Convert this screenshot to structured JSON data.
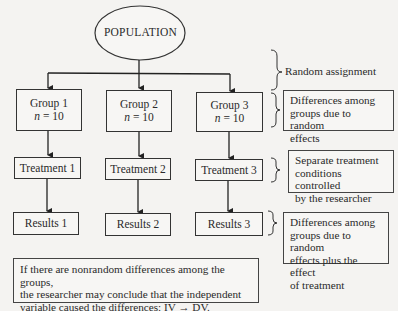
{
  "population": {
    "label": "POPULATION"
  },
  "groups": [
    {
      "label": "Group 1",
      "n_label": "n",
      "n_value": "= 10"
    },
    {
      "label": "Group 2",
      "n_label": "n",
      "n_value": "= 10"
    },
    {
      "label": "Group 3",
      "n_label": "n",
      "n_value": "= 10"
    }
  ],
  "treatments": [
    {
      "label": "Treatment 1"
    },
    {
      "label": "Treatment 2"
    },
    {
      "label": "Treatment 3"
    }
  ],
  "results": [
    {
      "label": "Results 1"
    },
    {
      "label": "Results 2"
    },
    {
      "label": "Results 3"
    }
  ],
  "annotations": {
    "random_assignment": "Random assignment",
    "groups_note": [
      "Differences among",
      "groups due to random",
      "effects"
    ],
    "treatment_note": [
      "Separate treatment",
      "conditions controlled",
      "by the researcher"
    ],
    "results_note": [
      "Differences among",
      "groups due to random",
      "effects plus the effect",
      "of treatment"
    ]
  },
  "conclusion": {
    "lines": [
      "If there are nonrandom differences among the groups,",
      "the researcher may conclude that the independent",
      "variable caused the differences: IV → DV."
    ]
  }
}
